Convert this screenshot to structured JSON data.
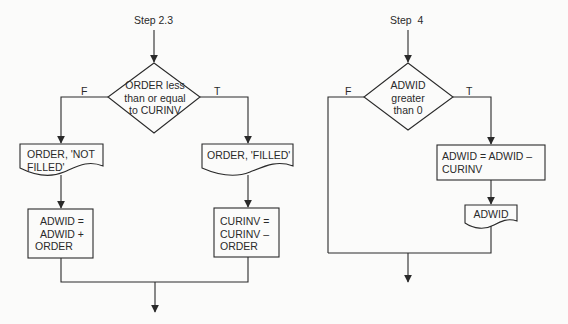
{
  "left_flow": {
    "step_label": "Step 2.3",
    "decision": {
      "lines": [
        "ORDER less",
        "than or equal",
        "to CURINV"
      ]
    },
    "false_label": "F",
    "true_label": "T",
    "false_output": {
      "lines": [
        "ORDER, 'NOT",
        "FILLED'"
      ]
    },
    "true_output": {
      "lines": [
        "ORDER, 'FILLED'"
      ]
    },
    "false_process": {
      "lines": [
        "ADWID =",
        "ADWID +",
        "ORDER"
      ]
    },
    "true_process": {
      "lines": [
        "CURINV =",
        "CURINV –",
        "ORDER"
      ]
    }
  },
  "right_flow": {
    "step_label": "Step  4",
    "decision": {
      "lines": [
        "ADWID",
        "greater",
        "than 0"
      ]
    },
    "false_label": "F",
    "true_label": "T",
    "true_process": {
      "lines": [
        "ADWID = ADWID –",
        "CURINV"
      ]
    },
    "true_output": {
      "lines": [
        "ADWID"
      ]
    }
  },
  "colors": {
    "line": "#2a2a2a",
    "background": "#fbfbfa"
  }
}
